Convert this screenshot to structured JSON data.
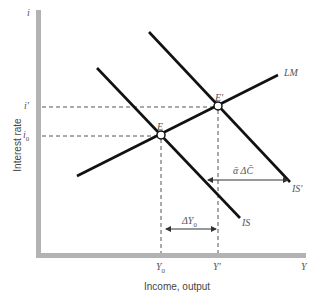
{
  "figure": {
    "y_axis_symbol": "i",
    "x_axis_symbol": "Y",
    "y_axis_label": "Interest rate",
    "x_axis_label": "Income, output",
    "y_ticks": {
      "i_prime": "i'",
      "i0": "i0"
    },
    "x_ticks": {
      "y0": "Y0",
      "y_prime": "Y'"
    },
    "curves": {
      "lm": "LM",
      "is": "IS",
      "is_prime": "IS'"
    },
    "points": {
      "e": "E",
      "e_prime": "E'"
    },
    "annotations": {
      "delta_y0": "ΔY0",
      "alpha_delta_c": "ᾱ ΔC̄"
    }
  },
  "colors": {
    "axis": "#b3b3b3",
    "curve": "#111111",
    "dash": "#555555",
    "text": "#555555"
  }
}
